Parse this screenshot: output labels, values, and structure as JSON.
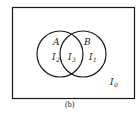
{
  "figure": {
    "caption": "(b)",
    "sets": [
      {
        "name": "A",
        "center": [
          60,
          54
        ],
        "radius": 23
      },
      {
        "name": "B",
        "center": [
          83,
          54
        ],
        "radius": 23
      }
    ],
    "regions": {
      "only_A": {
        "label": "I",
        "sub": "2"
      },
      "intersection": {
        "label": "I",
        "sub": "3"
      },
      "only_B": {
        "label": "I",
        "sub": "1"
      },
      "outside": {
        "label": "I",
        "sub": "0"
      }
    },
    "colors": {
      "stroke": "#1a1a1a",
      "background": "#ffffff"
    }
  }
}
